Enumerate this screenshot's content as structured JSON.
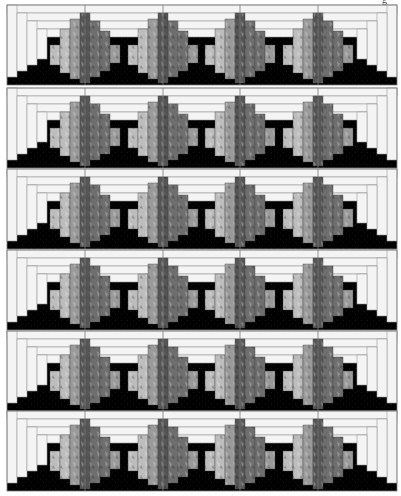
{
  "caption_fragment": "g",
  "quilt": {
    "left": 7,
    "right": 397,
    "row_tops": [
      5,
      88,
      169,
      250,
      331,
      411
    ],
    "row_height": 80,
    "peak_centers": [
      85,
      163,
      240,
      318
    ],
    "colors": {
      "background": "#000000",
      "strip_fill": "#f4f4f4",
      "strip_stroke": "#9a9a9a",
      "frame_stroke": "#7a7a7a",
      "peak_light": "#bdbdbd",
      "peak_mid": "#9a9a9a",
      "peak_dark": "#6e6e6e",
      "peak_darkest": "#555555"
    },
    "rows": [
      {
        "label": "row-1"
      },
      {
        "label": "row-2"
      },
      {
        "label": "row-3"
      },
      {
        "label": "row-4"
      },
      {
        "label": "row-5"
      },
      {
        "label": "row-6"
      }
    ]
  }
}
